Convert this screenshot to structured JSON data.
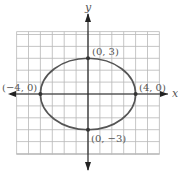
{
  "chart_data": {
    "type": "line",
    "title": "",
    "xlabel": "x",
    "ylabel": "y",
    "xlim": [
      -6,
      6
    ],
    "ylim": [
      -5,
      6
    ],
    "grid": true,
    "curve": {
      "shape": "ellipse",
      "center": [
        0,
        0
      ],
      "semi_major_x": 4,
      "semi_minor_y": 3,
      "equation": "x^2/16 + y^2/9 = 1"
    },
    "points": [
      {
        "x": 0,
        "y": 3,
        "label": "(0, 3)"
      },
      {
        "x": 4,
        "y": 0,
        "label": "(4, 0)"
      },
      {
        "x": -4,
        "y": 0,
        "label": "(−4, 0)"
      },
      {
        "x": 0,
        "y": -3,
        "label": "(0, −3)"
      }
    ]
  },
  "labels": {
    "x_axis": "x",
    "y_axis": "y",
    "top": "(0, 3)",
    "right": "(4, 0)",
    "left": "(−4, 0)",
    "bottom": "(0, −3)"
  },
  "colors": {
    "grid": "#b8b8b8",
    "axis": "#222222",
    "curve": "#555555",
    "label": "#555555"
  }
}
